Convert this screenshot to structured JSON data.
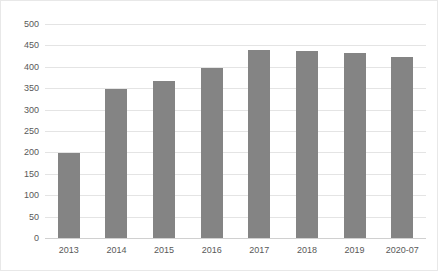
{
  "chart_data": {
    "type": "bar",
    "title": "",
    "subtitle": "",
    "xlabel": "",
    "ylabel": "",
    "categories": [
      "2013",
      "2014",
      "2015",
      "2016",
      "2017",
      "2018",
      "2019",
      "2020-07"
    ],
    "values": [
      199,
      348,
      368,
      398,
      440,
      437,
      433,
      423
    ],
    "series": [
      {
        "name": "",
        "values": [
          199,
          348,
          368,
          398,
          440,
          437,
          433,
          423
        ]
      }
    ],
    "ylim": [
      0,
      500
    ],
    "y_ticks": [
      0,
      50,
      100,
      150,
      200,
      250,
      300,
      350,
      400,
      450,
      500
    ],
    "y_tick_labels": [
      "0",
      "50",
      "100",
      "150",
      "200",
      "250",
      "300",
      "350",
      "400",
      "450",
      "500"
    ],
    "grid": true,
    "legend": false,
    "legend_position": "none",
    "bar_color": "#848484",
    "gridline_color": "#e4e4e4",
    "axis_color": "#d0d0d0",
    "tick_label_color": "#595959",
    "background_color": "#ffffff",
    "border_color": "#e8e8e8"
  }
}
